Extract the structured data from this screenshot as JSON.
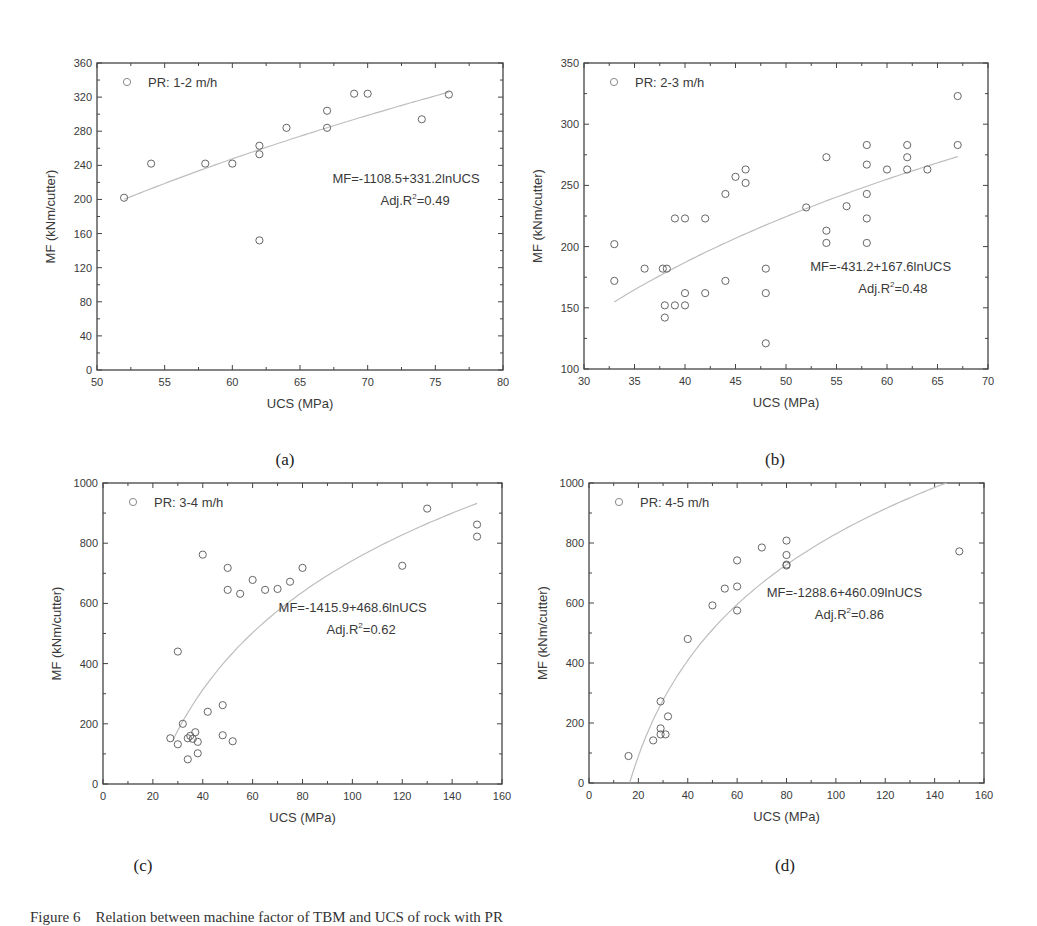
{
  "figure": {
    "caption": "Figure 6    Relation between machine factor of TBM and UCS of rock with PR",
    "sublabels": [
      "(a)",
      "(b)",
      "(c)",
      "(d)"
    ]
  },
  "chart_data": [
    {
      "id": "a",
      "type": "scatter",
      "title": "",
      "legend": "PR: 1-2 m/h",
      "legend_position": "top-left",
      "xlabel": "UCS (MPa)",
      "ylabel": "MF (kNm/cutter)",
      "xlim": [
        50,
        80
      ],
      "ylim": [
        0,
        360
      ],
      "xticks": [
        50,
        55,
        60,
        65,
        70,
        75,
        80
      ],
      "yticks": [
        0,
        40,
        80,
        120,
        160,
        200,
        240,
        280,
        320,
        360
      ],
      "grid": false,
      "fit": {
        "equation": "MF=-1108.5+331.2lnUCS",
        "r2_label": "Adj.R",
        "r2_value": "=0.49",
        "a": -1108.5,
        "b": 331.2,
        "x_range": [
          52,
          76
        ]
      },
      "annotation_pos": [
        0.58,
        0.39
      ],
      "x": [
        52,
        54,
        58,
        60,
        62,
        62,
        62,
        64,
        67,
        67,
        69,
        70,
        74,
        76
      ],
      "y": [
        202,
        242,
        242,
        242,
        263,
        253,
        152,
        284,
        304,
        284,
        324,
        324,
        294,
        323
      ]
    },
    {
      "id": "b",
      "type": "scatter",
      "title": "",
      "legend": "PR: 2-3 m/h",
      "legend_position": "top-left",
      "xlabel": "UCS (MPa)",
      "ylabel": "MF (kNm/cutter)",
      "xlim": [
        30,
        70
      ],
      "ylim": [
        100,
        350
      ],
      "xticks": [
        30,
        35,
        40,
        45,
        50,
        55,
        60,
        65,
        70
      ],
      "yticks": [
        100,
        150,
        200,
        250,
        300,
        350
      ],
      "grid": false,
      "fit": {
        "equation": "MF=-431.2+167.6lnUCS",
        "r2_label": "Adj.R",
        "r2_value": "=0.48",
        "a": -431.2,
        "b": 167.6,
        "x_range": [
          33,
          67
        ]
      },
      "annotation_pos": [
        0.56,
        0.68
      ],
      "x": [
        33,
        33,
        36,
        37.8,
        38.2,
        38,
        38,
        39,
        40,
        39,
        40,
        40,
        42,
        42,
        44,
        44,
        45,
        46,
        46,
        48,
        48,
        48,
        52,
        54,
        54,
        54,
        56,
        58,
        58,
        58,
        58,
        58,
        60,
        62,
        62,
        62,
        64,
        67,
        67
      ],
      "y": [
        202,
        172,
        182,
        182,
        182,
        152,
        142,
        223,
        223,
        152,
        152,
        162,
        223,
        162,
        243,
        172,
        257,
        263,
        252,
        182,
        162,
        121,
        232,
        273,
        213,
        203,
        233,
        283,
        267,
        243,
        223,
        203,
        263,
        283,
        273,
        263,
        263,
        323,
        283
      ]
    },
    {
      "id": "c",
      "type": "scatter",
      "title": "",
      "legend": "PR: 3-4 m/h",
      "legend_position": "top-left",
      "xlabel": "UCS (MPa)",
      "ylabel": "MF (kNm/cutter)",
      "xlim": [
        0,
        160
      ],
      "ylim": [
        0,
        1000
      ],
      "xticks": [
        0,
        20,
        40,
        60,
        80,
        100,
        120,
        140,
        160
      ],
      "yticks": [
        0,
        200,
        400,
        600,
        800,
        1000
      ],
      "grid": false,
      "fit": {
        "equation": "MF=-1415.9+468.6lnUCS",
        "r2_label": "Adj.R",
        "r2_value": "=0.62",
        "a": -1415.9,
        "b": 468.6,
        "x_range": [
          28,
          150
        ]
      },
      "annotation_pos": [
        0.44,
        0.43
      ],
      "x": [
        27,
        30,
        30,
        32,
        34,
        34,
        35,
        36,
        37,
        38,
        38,
        40,
        42,
        48,
        48,
        50,
        50,
        52,
        55,
        60,
        65,
        70,
        75,
        80,
        120,
        130,
        150,
        150
      ],
      "y": [
        152,
        132,
        440,
        200,
        152,
        82,
        160,
        150,
        172,
        140,
        102,
        762,
        240,
        262,
        162,
        718,
        645,
        142,
        632,
        678,
        645,
        648,
        672,
        718,
        725,
        915,
        862,
        822
      ]
    },
    {
      "id": "d",
      "type": "scatter",
      "title": "",
      "legend": "PR: 4-5 m/h",
      "legend_position": "top-left",
      "xlabel": "UCS (MPa)",
      "ylabel": "MF (kNm/cutter)",
      "xlim": [
        0,
        160
      ],
      "ylim": [
        0,
        1000
      ],
      "xticks": [
        0,
        20,
        40,
        60,
        80,
        100,
        120,
        140,
        160
      ],
      "yticks": [
        0,
        200,
        400,
        600,
        800,
        1000
      ],
      "grid": false,
      "fit": {
        "equation": "MF=-1288.6+460.09lnUCS",
        "r2_label": "Adj.R",
        "r2_value": "=0.86",
        "a": -1288.6,
        "b": 460.09,
        "x_range": [
          16.5,
          145
        ]
      },
      "annotation_pos": [
        0.45,
        0.38
      ],
      "x": [
        16,
        26,
        29,
        29,
        29,
        31,
        32,
        40,
        50,
        55,
        60,
        60,
        60,
        70,
        80,
        80,
        80,
        80,
        150
      ],
      "y": [
        90,
        142,
        272,
        182,
        162,
        162,
        222,
        480,
        592,
        648,
        742,
        655,
        575,
        785,
        808,
        760,
        728,
        725,
        772
      ]
    }
  ],
  "layout": {
    "panels": [
      {
        "left": 97,
        "top": 63,
        "right": 503,
        "bottom": 370,
        "sub_x": 285,
        "sub_y": 450
      },
      {
        "left": 584,
        "top": 63,
        "right": 988,
        "bottom": 369,
        "sub_x": 775,
        "sub_y": 450
      },
      {
        "left": 103,
        "top": 483,
        "right": 502,
        "bottom": 784,
        "sub_x": 143,
        "sub_y": 856
      },
      {
        "left": 589,
        "top": 483,
        "right": 984,
        "bottom": 783,
        "sub_x": 785,
        "sub_y": 856
      }
    ]
  }
}
